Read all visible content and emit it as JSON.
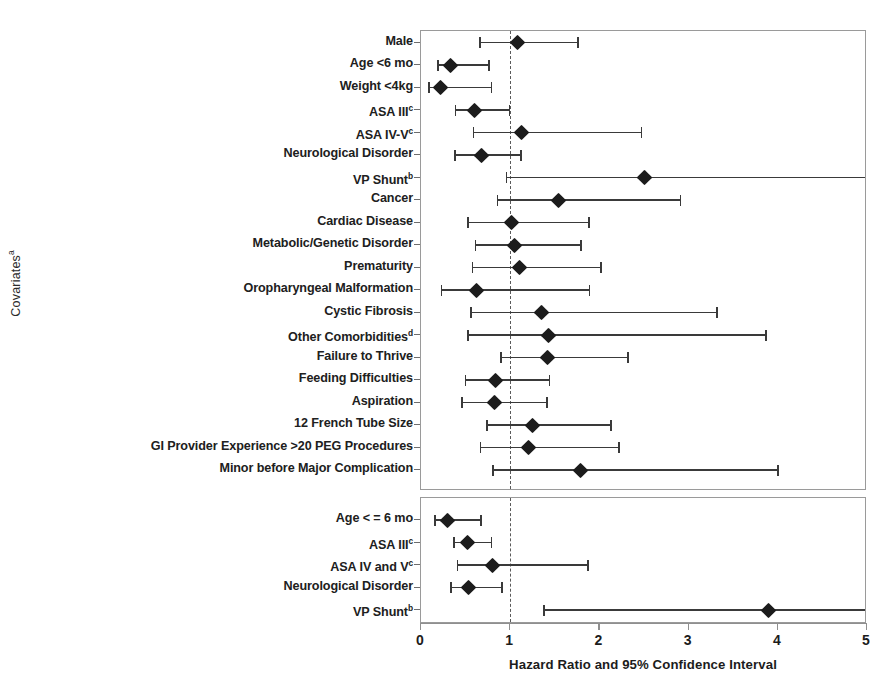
{
  "axes": {
    "ylabel": "Covariates",
    "ylabel_sup": "a",
    "xlabel": "Hazard Ratio and 95% Confidence Interval",
    "xticks": [
      "0",
      "1",
      "2",
      "3",
      "4",
      "5"
    ],
    "xlim": [
      0,
      5
    ],
    "reference_line": 1
  },
  "chart_data": {
    "type": "forest",
    "title": "",
    "xlabel": "Hazard Ratio and 95% Confidence Interval",
    "ylabel": "Covariates",
    "xlim": [
      0,
      5
    ],
    "xticks": [
      0,
      1,
      2,
      3,
      4,
      5
    ],
    "reference_line": 1,
    "grid": false,
    "legend": "none",
    "panels": [
      {
        "name": "panel-upper",
        "rows": [
          {
            "label": "Male",
            "sup": "",
            "hr": 1.08,
            "lo": 0.65,
            "hi": 1.77,
            "hi_clipped": false
          },
          {
            "label": "Age <6 mo",
            "sup": "",
            "hr": 0.33,
            "lo": 0.18,
            "hi": 0.77,
            "hi_clipped": false
          },
          {
            "label": "Weight <4kg",
            "sup": "",
            "hr": 0.22,
            "lo": 0.08,
            "hi": 0.8,
            "hi_clipped": false
          },
          {
            "label": "ASA III",
            "sup": "c",
            "hr": 0.6,
            "lo": 0.38,
            "hi": 1.0,
            "hi_clipped": false
          },
          {
            "label": "ASA IV-V",
            "sup": "c",
            "hr": 1.13,
            "lo": 0.58,
            "hi": 2.48,
            "hi_clipped": false
          },
          {
            "label": "Neurological Disorder",
            "sup": "",
            "hr": 0.68,
            "lo": 0.37,
            "hi": 1.13,
            "hi_clipped": false
          },
          {
            "label": "VP Shunt",
            "sup": "b",
            "hr": 2.5,
            "lo": 0.95,
            "hi": 5.0,
            "hi_clipped": true
          },
          {
            "label": "Cancer",
            "sup": "",
            "hr": 1.54,
            "lo": 0.85,
            "hi": 2.92,
            "hi_clipped": false
          },
          {
            "label": "Cardiac Disease",
            "sup": "",
            "hr": 1.02,
            "lo": 0.52,
            "hi": 1.89,
            "hi_clipped": false
          },
          {
            "label": "Metabolic/Genetic Disorder",
            "sup": "",
            "hr": 1.05,
            "lo": 0.6,
            "hi": 1.8,
            "hi_clipped": false
          },
          {
            "label": "Prematurity",
            "sup": "",
            "hr": 1.1,
            "lo": 0.57,
            "hi": 2.03,
            "hi_clipped": false
          },
          {
            "label": "Oropharyngeal Malformation",
            "sup": "",
            "hr": 0.62,
            "lo": 0.22,
            "hi": 1.9,
            "hi_clipped": false
          },
          {
            "label": "Cystic Fibrosis",
            "sup": "",
            "hr": 1.35,
            "lo": 0.55,
            "hi": 3.33,
            "hi_clipped": false
          },
          {
            "label": "Other Comorbidities",
            "sup": "d",
            "hr": 1.43,
            "lo": 0.52,
            "hi": 3.88,
            "hi_clipped": false
          },
          {
            "label": "Failure to Thrive",
            "sup": "",
            "hr": 1.42,
            "lo": 0.89,
            "hi": 2.33,
            "hi_clipped": false
          },
          {
            "label": "Feeding Difficulties",
            "sup": "",
            "hr": 0.84,
            "lo": 0.49,
            "hi": 1.45,
            "hi_clipped": false
          },
          {
            "label": "Aspiration",
            "sup": "",
            "hr": 0.82,
            "lo": 0.45,
            "hi": 1.42,
            "hi_clipped": false
          },
          {
            "label": "12 French Tube Size",
            "sup": "",
            "hr": 1.25,
            "lo": 0.73,
            "hi": 2.14,
            "hi_clipped": false
          },
          {
            "label": "GI Provider Experience >20 PEG Procedures",
            "sup": "",
            "hr": 1.21,
            "lo": 0.66,
            "hi": 2.23,
            "hi_clipped": false
          },
          {
            "label": "Minor before Major Complication",
            "sup": "",
            "hr": 1.79,
            "lo": 0.8,
            "hi": 4.01,
            "hi_clipped": false
          }
        ]
      },
      {
        "name": "panel-lower",
        "rows": [
          {
            "label": "Age < = 6 mo",
            "sup": "",
            "hr": 0.3,
            "lo": 0.15,
            "hi": 0.68,
            "hi_clipped": false
          },
          {
            "label": "ASA III",
            "sup": "c",
            "hr": 0.52,
            "lo": 0.36,
            "hi": 0.8,
            "hi_clipped": false
          },
          {
            "label": "ASA IV and V",
            "sup": "c",
            "hr": 0.8,
            "lo": 0.4,
            "hi": 1.88,
            "hi_clipped": false
          },
          {
            "label": "Neurological Disorder",
            "sup": "",
            "hr": 0.53,
            "lo": 0.33,
            "hi": 0.92,
            "hi_clipped": false
          },
          {
            "label": "VP Shunt",
            "sup": "b",
            "hr": 3.9,
            "lo": 1.37,
            "hi": 5.0,
            "hi_clipped": true
          }
        ]
      }
    ]
  },
  "colors": {
    "marker": "#1c1c1c",
    "line": "#3a3a3a",
    "axis": "#8f8f8f",
    "panel_border": "#9a9a9a",
    "reference": "#5a5a5a"
  }
}
